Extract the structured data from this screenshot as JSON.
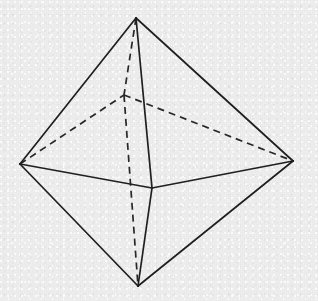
{
  "figure": {
    "shape_name": "octahedron",
    "canvas": {
      "width": 318,
      "height": 301
    },
    "background_color": "#eeeeee",
    "line_color": "#1e1e1e",
    "hidden_line_color": "#262626",
    "line_width": 1.7,
    "hidden_dash_pattern": "7 5",
    "vertices": [
      {
        "id": "apex-top",
        "label": "top apex",
        "x": 136,
        "y": 18,
        "hidden": false
      },
      {
        "id": "vertex-left",
        "label": "left vertex",
        "x": 20,
        "y": 164,
        "hidden": false
      },
      {
        "id": "vertex-right",
        "label": "right vertex",
        "x": 293,
        "y": 161,
        "hidden": false
      },
      {
        "id": "apex-bottom",
        "label": "bottom apex",
        "x": 138,
        "y": 286,
        "hidden": false
      },
      {
        "id": "vertex-front",
        "label": "front vertex",
        "x": 152,
        "y": 188,
        "hidden": false
      },
      {
        "id": "vertex-back",
        "label": "back vertex (hidden)",
        "x": 124,
        "y": 95,
        "hidden": true
      }
    ],
    "edges": [
      {
        "id": "e-apex-left",
        "from": "apex-top",
        "to": "vertex-left",
        "style": "solid"
      },
      {
        "id": "e-apex-right",
        "from": "apex-top",
        "to": "vertex-right",
        "style": "solid"
      },
      {
        "id": "e-apex-front",
        "from": "apex-top",
        "to": "vertex-front",
        "style": "solid"
      },
      {
        "id": "e-left-front",
        "from": "vertex-left",
        "to": "vertex-front",
        "style": "solid"
      },
      {
        "id": "e-front-right",
        "from": "vertex-front",
        "to": "vertex-right",
        "style": "solid"
      },
      {
        "id": "e-left-bottom",
        "from": "vertex-left",
        "to": "apex-bottom",
        "style": "solid"
      },
      {
        "id": "e-right-bottom",
        "from": "vertex-right",
        "to": "apex-bottom",
        "style": "solid"
      },
      {
        "id": "e-front-bottom",
        "from": "vertex-front",
        "to": "apex-bottom",
        "style": "solid"
      },
      {
        "id": "e-apex-back",
        "from": "apex-top",
        "to": "vertex-back",
        "style": "dashed"
      },
      {
        "id": "e-back-bottom",
        "from": "vertex-back",
        "to": "apex-bottom",
        "style": "dashed"
      },
      {
        "id": "e-left-back",
        "from": "vertex-left",
        "to": "vertex-back",
        "style": "dashed"
      },
      {
        "id": "e-back-right",
        "from": "vertex-back",
        "to": "vertex-right",
        "style": "dashed"
      }
    ],
    "labels": []
  }
}
